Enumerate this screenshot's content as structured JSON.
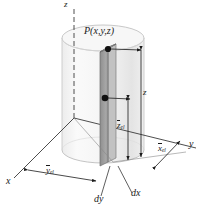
{
  "figure": {
    "background_color": "#ffffff",
    "ink_color": "#1a1a1a"
  },
  "axes": [
    {
      "name": "z-axis",
      "label": "z",
      "style": "dashed-vertical"
    },
    {
      "name": "y-axis",
      "label": "y",
      "style": "solid-right"
    },
    {
      "name": "x-axis",
      "label": "x",
      "style": "solid-left"
    }
  ],
  "point": {
    "label_text": "P(x,y,z)",
    "name": "point-P"
  },
  "dimensions": [
    {
      "name": "z-height",
      "label": "z",
      "overbar": false,
      "subscript": ""
    },
    {
      "name": "z-el",
      "label": "z",
      "overbar": true,
      "subscript": "el"
    },
    {
      "name": "x-el",
      "label": "x",
      "overbar": true,
      "subscript": "el"
    },
    {
      "name": "y-el",
      "label": "y",
      "overbar": true,
      "subscript": "el"
    }
  ],
  "differentials": [
    {
      "name": "dy",
      "label": "dy"
    },
    {
      "name": "dx",
      "label": "dx"
    }
  ],
  "solid": {
    "shape": "cylinder",
    "fill": "#f2f2f2",
    "edge": "#c9c9c9"
  },
  "element": {
    "shape": "rectangular-column",
    "front_fill": "#9e9e9e",
    "side_fill": "#c4c4c4",
    "top_fill": "#b5b5b5"
  },
  "labels": {
    "z_axis": "z",
    "y_axis": "y",
    "x_axis": "x",
    "point_P": "P(x,y,z)",
    "dy": "dy",
    "dx": "dx",
    "z_height": "z",
    "z_el_base": "z",
    "z_el_sub": "el",
    "x_el_base": "x",
    "x_el_sub": "el",
    "y_el_base": "y",
    "y_el_sub": "el"
  }
}
